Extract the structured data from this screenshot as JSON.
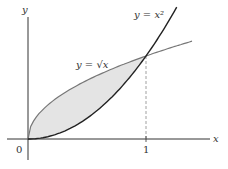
{
  "chart_data": {
    "type": "area",
    "title": "",
    "xlabel": "x",
    "ylabel": "y",
    "x_ticks": [
      "0",
      "1"
    ],
    "series": [
      {
        "name": "y = x^2",
        "x": [
          0,
          0.25,
          0.5,
          0.75,
          1,
          1.25
        ],
        "values": [
          0,
          0.0625,
          0.25,
          0.5625,
          1,
          1.5625
        ],
        "color": "#222222"
      },
      {
        "name": "y = √x",
        "x": [
          0,
          0.25,
          0.5,
          0.75,
          1,
          1.39
        ],
        "values": [
          0,
          0.5,
          0.707,
          0.866,
          1,
          1.18
        ],
        "color": "#777777"
      }
    ],
    "shaded_region": {
      "between": [
        "y = √x",
        "y = x^2"
      ],
      "x_range": [
        0,
        1
      ],
      "fill": "#e6e6e6"
    },
    "annotations": [
      {
        "type": "dashed-vertical-line",
        "x": 1,
        "from_y": 0,
        "to_y": 1
      }
    ],
    "xlim": [
      -0.2,
      1.55
    ],
    "ylim": [
      -0.35,
      1.68
    ],
    "grid": false
  },
  "labels": {
    "y_axis": "y",
    "x_axis": "x",
    "origin": "0",
    "tick_one": "1",
    "curve_parabola": "y = x²",
    "curve_sqrt": "y = √x"
  }
}
